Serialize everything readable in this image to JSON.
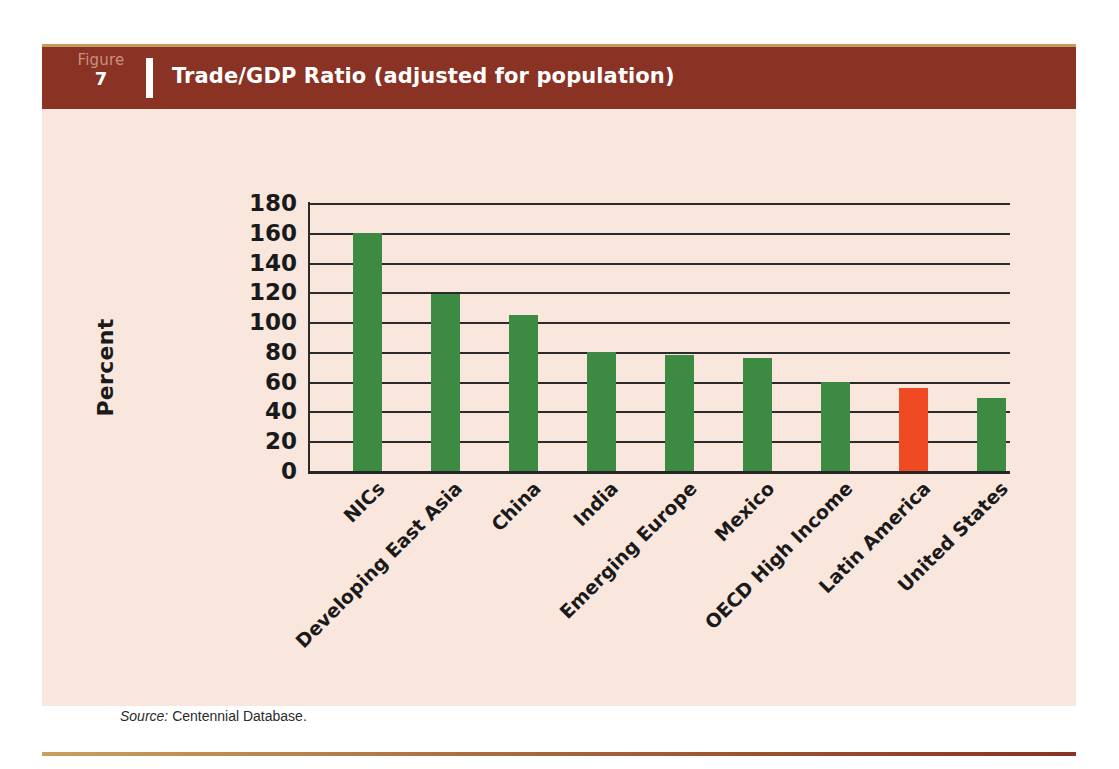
{
  "figure": {
    "word": "Figure",
    "number": "7",
    "title": "Trade/GDP Ratio (adjusted for population)"
  },
  "source": {
    "label": "Source:",
    "text": " Centennial Database."
  },
  "colors": {
    "panel_background": "#f9e6dd",
    "header_brown": "#8a3224",
    "header_topline_gold": "#c79a5a",
    "figure_word_muted": "#c9907f",
    "bar_green": "#3d8b43",
    "bar_orange": "#f04a23",
    "axis_black": "#2b2b2b",
    "text_black": "#1a1a1a"
  },
  "chart_data": {
    "type": "bar",
    "title": "Trade/GDP Ratio (adjusted for population)",
    "xlabel": "",
    "ylabel": "Percent",
    "ylim": [
      0,
      180
    ],
    "ytick_step": 20,
    "yticks": [
      180,
      160,
      140,
      120,
      100,
      80,
      60,
      40,
      20,
      0
    ],
    "grid": true,
    "legend": "none",
    "categories": [
      "NICs",
      "Developing East Asia",
      "China",
      "India",
      "Emerging Europe",
      "Mexico",
      "OECD High Income",
      "Latin America",
      "United States"
    ],
    "values": [
      160,
      119,
      105,
      80,
      78,
      76,
      60,
      56,
      49
    ],
    "bar_colors": [
      "#3d8b43",
      "#3d8b43",
      "#3d8b43",
      "#3d8b43",
      "#3d8b43",
      "#3d8b43",
      "#3d8b43",
      "#f04a23",
      "#3d8b43"
    ],
    "highlighted_category": "Latin America"
  }
}
